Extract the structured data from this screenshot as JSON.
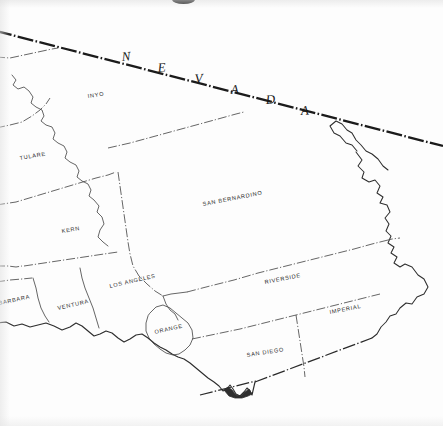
{
  "map": {
    "title": "Southern California Counties",
    "background_color": "#fdfdfd",
    "ink_color": "#2b2b2b",
    "state_label": "N E V A D A",
    "state_label_letters": [
      "N",
      "E",
      "V",
      "A",
      "D",
      "A"
    ],
    "counties": [
      {
        "id": "inyo",
        "label": "INYO",
        "x": 100,
        "y": 96,
        "rotate": -9
      },
      {
        "id": "tulare",
        "label": "TULARE",
        "x": 18,
        "y": 158,
        "rotate": -10
      },
      {
        "id": "kern",
        "label": "KERN",
        "x": 62,
        "y": 231,
        "rotate": -9
      },
      {
        "id": "san-bernardino",
        "label": "SAN BERNARDINO",
        "x": 204,
        "y": 201,
        "rotate": -11
      },
      {
        "id": "los-angeles",
        "label": "LOS ANGELES",
        "x": 112,
        "y": 285,
        "rotate": -13
      },
      {
        "id": "ventura",
        "label": "VENTURA",
        "x": 60,
        "y": 305,
        "rotate": -13
      },
      {
        "id": "santa-barbara",
        "label": "BARBARA",
        "x": -2,
        "y": 302,
        "rotate": -12
      },
      {
        "id": "orange",
        "label": "ORANGE",
        "x": 157,
        "y": 331,
        "rotate": -13
      },
      {
        "id": "riverside",
        "label": "RIVERSIDE",
        "x": 267,
        "y": 281,
        "rotate": -11
      },
      {
        "id": "imperial",
        "label": "IMPERIAL",
        "x": 331,
        "y": 311,
        "rotate": -11
      },
      {
        "id": "san-diego",
        "label": "SAN DIEGO",
        "x": 248,
        "y": 354,
        "rotate": -9
      }
    ],
    "borders": {
      "state_line_style": "thick dash-dot",
      "county_line_style": "thin dash-dot",
      "coast_line_style": "solid",
      "mexico_line_style": "dash-dot"
    }
  }
}
